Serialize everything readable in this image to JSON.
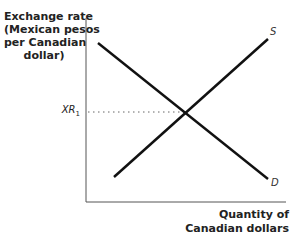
{
  "diagram": {
    "type": "supply-demand",
    "y_axis_label_lines": [
      "Exchange rate",
      "(Mexican pesos",
      "per Canadian",
      "dollar)"
    ],
    "x_axis_label_lines": [
      "Quantity of",
      "Canadian dollars"
    ],
    "equilibrium_label": "XR",
    "equilibrium_subscript": "1",
    "curves": [
      {
        "name": "S",
        "label": "S",
        "slope": "upward"
      },
      {
        "name": "D",
        "label": "D",
        "slope": "downward"
      }
    ],
    "colors": {
      "line": "#111111",
      "axis": "#555555",
      "dotted": "#666666"
    }
  }
}
